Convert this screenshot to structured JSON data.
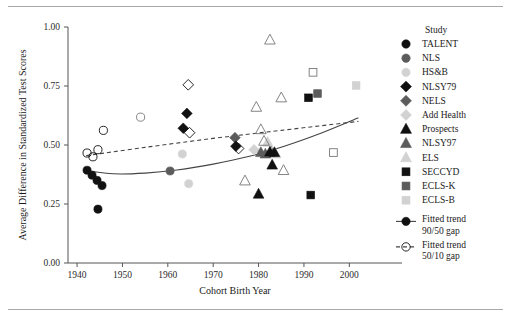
{
  "chart_data": {
    "type": "scatter",
    "title": "",
    "xlabel": "Cohort Birth Year",
    "ylabel": "Average Difference in Standardized Test Scores",
    "xlim": [
      1938,
      2005
    ],
    "ylim": [
      0.0,
      1.0
    ],
    "xticks": [
      1940,
      1950,
      1960,
      1970,
      1980,
      1990,
      2000
    ],
    "yticks": [
      0.0,
      0.25,
      0.5,
      0.75,
      1.0
    ],
    "xtick_labels": [
      "1940",
      "1950",
      "1960",
      "1970",
      "1980",
      "1990",
      "2000"
    ],
    "ytick_labels": [
      "0.00",
      "0.25",
      "0.50",
      "0.75",
      "1.00"
    ],
    "grid": false,
    "legend_position": "right",
    "legend_title": "Study",
    "series": [
      {
        "name": "TALENT",
        "marker": "circle",
        "fill": "#111111",
        "stroke": "#111111",
        "points": [
          {
            "x": 1942.2,
            "y": 0.393
          },
          {
            "x": 1943.3,
            "y": 0.372
          },
          {
            "x": 1944.4,
            "y": 0.35
          },
          {
            "x": 1945.5,
            "y": 0.328
          },
          {
            "x": 1944.6,
            "y": 0.228
          }
        ]
      },
      {
        "name": "NLS",
        "marker": "circle",
        "fill": "#5c5c5c",
        "stroke": "#5c5c5c",
        "points": [
          {
            "x": 1960.5,
            "y": 0.39
          }
        ]
      },
      {
        "name": "HS&B",
        "marker": "circle",
        "fill": "#d2d2d2",
        "stroke": "#d2d2d2",
        "points": [
          {
            "x": 1963.2,
            "y": 0.462
          },
          {
            "x": 1964.6,
            "y": 0.336
          }
        ]
      },
      {
        "name": "NLSY79",
        "marker": "diamond",
        "fill": "#111111",
        "stroke": "#111111",
        "points": [
          {
            "x": 1964.2,
            "y": 0.634
          },
          {
            "x": 1963.4,
            "y": 0.571
          },
          {
            "x": 1975.0,
            "y": 0.495
          }
        ]
      },
      {
        "name": "NELS",
        "marker": "diamond",
        "fill": "#5c5c5c",
        "stroke": "#5c5c5c",
        "points": [
          {
            "x": 1974.8,
            "y": 0.531
          }
        ]
      },
      {
        "name": "Add Health",
        "marker": "diamond",
        "fill": "#d2d2d2",
        "stroke": "#d2d2d2",
        "points": [
          {
            "x": 1979.0,
            "y": 0.48
          }
        ]
      },
      {
        "name": "Prospects",
        "marker": "triangle",
        "fill": "#111111",
        "stroke": "#111111",
        "points": [
          {
            "x": 1982.5,
            "y": 0.47
          },
          {
            "x": 1983.5,
            "y": 0.468
          },
          {
            "x": 1983.0,
            "y": 0.415
          },
          {
            "x": 1980.0,
            "y": 0.292
          }
        ]
      },
      {
        "name": "NLSY97",
        "marker": "triangle",
        "fill": "#5c5c5c",
        "stroke": "#5c5c5c",
        "points": [
          {
            "x": 1980.5,
            "y": 0.468
          },
          {
            "x": 1981.5,
            "y": 0.462
          }
        ]
      },
      {
        "name": "ELS",
        "marker": "triangle",
        "fill": "#d2d2d2",
        "stroke": "#d2d2d2",
        "points": [
          {
            "x": 1983.8,
            "y": 0.462
          },
          {
            "x": 1982.0,
            "y": 0.512
          }
        ]
      },
      {
        "name": "SECCYD",
        "marker": "square",
        "fill": "#111111",
        "stroke": "#111111",
        "points": [
          {
            "x": 1991.0,
            "y": 0.7
          },
          {
            "x": 1991.5,
            "y": 0.288
          }
        ]
      },
      {
        "name": "ECLS-K",
        "marker": "square",
        "fill": "#5c5c5c",
        "stroke": "#5c5c5c",
        "points": [
          {
            "x": 1993.0,
            "y": 0.718
          }
        ]
      },
      {
        "name": "ECLS-B",
        "marker": "square",
        "fill": "#d2d2d2",
        "stroke": "#d2d2d2",
        "points": [
          {
            "x": 2001.5,
            "y": 0.752
          }
        ]
      },
      {
        "name": "TALENT 50/10",
        "marker": "circle-open",
        "fill": "none",
        "stroke": "#111111",
        "points": [
          {
            "x": 1942.2,
            "y": 0.466
          },
          {
            "x": 1943.5,
            "y": 0.45
          },
          {
            "x": 1944.6,
            "y": 0.48
          },
          {
            "x": 1945.8,
            "y": 0.562
          }
        ]
      },
      {
        "name": "HS&B 50/10",
        "marker": "circle-open",
        "fill": "none",
        "stroke": "#777777",
        "points": [
          {
            "x": 1954.0,
            "y": 0.618
          }
        ]
      },
      {
        "name": "NLSY79 50/10",
        "marker": "diamond-open",
        "fill": "none",
        "stroke": "#111111",
        "points": [
          {
            "x": 1964.5,
            "y": 0.755
          },
          {
            "x": 1964.8,
            "y": 0.552
          },
          {
            "x": 1975.6,
            "y": 0.485
          }
        ]
      },
      {
        "name": "ELS open",
        "marker": "triangle-open",
        "fill": "none",
        "stroke": "#777777",
        "points": [
          {
            "x": 1982.5,
            "y": 0.945
          },
          {
            "x": 1979.5,
            "y": 0.66
          },
          {
            "x": 1980.5,
            "y": 0.565
          },
          {
            "x": 1981.2,
            "y": 0.516
          },
          {
            "x": 1982.8,
            "y": 0.47
          },
          {
            "x": 1985.5,
            "y": 0.392
          },
          {
            "x": 1977.0,
            "y": 0.348
          },
          {
            "x": 1985.0,
            "y": 0.7
          }
        ]
      },
      {
        "name": "SECCYD open",
        "marker": "square-open",
        "fill": "none",
        "stroke": "#777777",
        "points": [
          {
            "x": 1992.0,
            "y": 0.808
          },
          {
            "x": 1996.5,
            "y": 0.468
          }
        ]
      }
    ],
    "trend_lines": [
      {
        "name": "Fitted trend 90/50 gap",
        "style": "solid",
        "points": [
          {
            "x": 1942.0,
            "y": 0.392
          },
          {
            "x": 1948.0,
            "y": 0.378
          },
          {
            "x": 1955.0,
            "y": 0.381
          },
          {
            "x": 1962.0,
            "y": 0.394
          },
          {
            "x": 1970.0,
            "y": 0.419
          },
          {
            "x": 1978.0,
            "y": 0.452
          },
          {
            "x": 1986.0,
            "y": 0.497
          },
          {
            "x": 1994.0,
            "y": 0.552
          },
          {
            "x": 2002.0,
            "y": 0.615
          }
        ]
      },
      {
        "name": "Fitted trend 50/10 gap",
        "style": "dashed",
        "points": [
          {
            "x": 1942.0,
            "y": 0.455
          },
          {
            "x": 1955.0,
            "y": 0.49
          },
          {
            "x": 1970.0,
            "y": 0.528
          },
          {
            "x": 1985.0,
            "y": 0.562
          },
          {
            "x": 2002.0,
            "y": 0.6
          }
        ]
      }
    ],
    "legend_entries": [
      {
        "label": "TALENT",
        "marker": "circle",
        "fill": "#111111"
      },
      {
        "label": "NLS",
        "marker": "circle",
        "fill": "#5c5c5c"
      },
      {
        "label": "HS&B",
        "marker": "circle",
        "fill": "#d2d2d2"
      },
      {
        "label": "NLSY79",
        "marker": "diamond",
        "fill": "#111111"
      },
      {
        "label": "NELS",
        "marker": "diamond",
        "fill": "#5c5c5c"
      },
      {
        "label": "Add Health",
        "marker": "diamond",
        "fill": "#d2d2d2"
      },
      {
        "label": "Prospects",
        "marker": "triangle",
        "fill": "#111111"
      },
      {
        "label": "NLSY97",
        "marker": "triangle",
        "fill": "#5c5c5c"
      },
      {
        "label": "ELS",
        "marker": "triangle",
        "fill": "#d2d2d2"
      },
      {
        "label": "SECCYD",
        "marker": "square",
        "fill": "#111111"
      },
      {
        "label": "ECLS-K",
        "marker": "square",
        "fill": "#5c5c5c"
      },
      {
        "label": "ECLS-B",
        "marker": "square",
        "fill": "#d2d2d2"
      }
    ],
    "legend_trend_entries": [
      {
        "label_line1": "Fitted trend",
        "label_line2": "90/50 gap",
        "marker": "circle",
        "style": "solid"
      },
      {
        "label_line1": "Fitted trend",
        "label_line2": "50/10 gap",
        "marker": "circle-open",
        "style": "dashed"
      }
    ]
  }
}
